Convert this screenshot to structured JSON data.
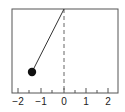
{
  "diagram": {
    "frame": {
      "x0": 12,
      "y0": 9,
      "x1": 118,
      "y1": 93
    },
    "axis": {
      "xlim": [
        -2.3,
        2.4
      ],
      "major_ticks": [
        -2,
        -1,
        0,
        1,
        2
      ],
      "tick_labels": [
        "−2",
        "−1",
        "0",
        "1",
        "2"
      ],
      "minor_step": 0.5
    },
    "pivot": {
      "x": 0,
      "label": "pivot"
    },
    "bob": {
      "x": -1.4,
      "label": "bob"
    },
    "vertical_reference": {
      "style": "dashed",
      "x": 0
    },
    "colors": {
      "frame": "#555555",
      "rod": "#333333",
      "bob": "#111111",
      "dashed": "#666666"
    }
  }
}
